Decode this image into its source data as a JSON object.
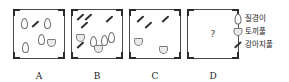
{
  "figure": {
    "question_mark": "?",
    "panels": [
      {
        "id": "A",
        "label": "A",
        "specimens": [
          {
            "type": "oval",
            "x": 7,
            "y": 8
          },
          {
            "type": "oval",
            "x": 30,
            "y": 8
          },
          {
            "type": "stroke",
            "x": 17,
            "y": 13
          },
          {
            "type": "oval",
            "x": 24,
            "y": 24
          },
          {
            "type": "heart",
            "x": 33,
            "y": 29
          },
          {
            "type": "oval",
            "x": 8,
            "y": 32
          }
        ]
      },
      {
        "id": "B",
        "label": "B",
        "specimens": [
          {
            "type": "stroke",
            "x": 4,
            "y": 6
          },
          {
            "type": "stroke",
            "x": 12,
            "y": 6
          },
          {
            "type": "stroke",
            "x": 8,
            "y": 14
          },
          {
            "type": "stroke",
            "x": 33,
            "y": 8
          },
          {
            "type": "heart",
            "x": 4,
            "y": 24
          },
          {
            "type": "oval",
            "x": 18,
            "y": 26
          },
          {
            "type": "oval",
            "x": 29,
            "y": 25
          },
          {
            "type": "oval",
            "x": 36,
            "y": 22
          },
          {
            "type": "stroke",
            "x": 4,
            "y": 34
          },
          {
            "type": "heart",
            "x": 22,
            "y": 35
          }
        ]
      },
      {
        "id": "C",
        "label": "C",
        "specimens": [
          {
            "type": "stroke",
            "x": 6,
            "y": 8
          },
          {
            "type": "stroke",
            "x": 14,
            "y": 14
          },
          {
            "type": "stroke",
            "x": 31,
            "y": 8
          },
          {
            "type": "heart",
            "x": 4,
            "y": 28
          },
          {
            "type": "heart",
            "x": 29,
            "y": 36
          }
        ]
      },
      {
        "id": "D",
        "label": "D",
        "specimens": []
      }
    ]
  },
  "legend": {
    "items": [
      {
        "icon": "oval-leaf-icon",
        "label": "질경이"
      },
      {
        "icon": "heart-leaf-icon",
        "label": "토끼풀"
      },
      {
        "icon": "stroke-icon",
        "label": "강아지풀"
      }
    ]
  }
}
